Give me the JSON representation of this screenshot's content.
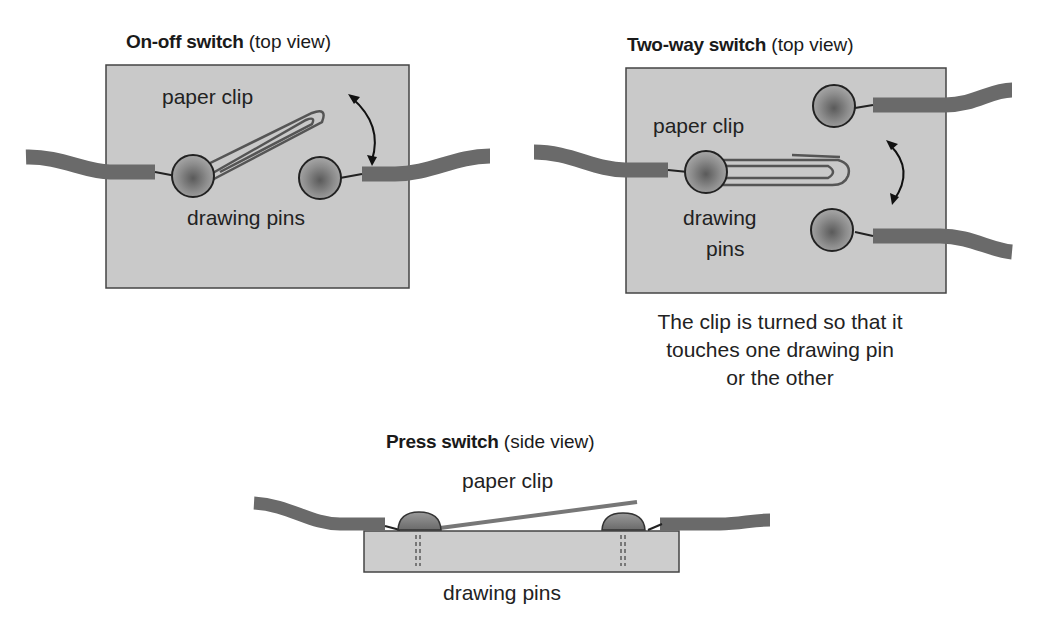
{
  "diagrams": {
    "on_off": {
      "title_bold": "On-off switch",
      "title_rest": " (top view)",
      "label_clip": "paper clip",
      "label_pins": "drawing pins"
    },
    "two_way": {
      "title_bold": "Two-way switch",
      "title_rest": " (top view)",
      "label_clip": "paper clip",
      "label_pins_line1": "drawing",
      "label_pins_line2": "pins",
      "caption_line1": "The clip is turned so that it",
      "caption_line2": "touches one drawing pin",
      "caption_line3": "or the other"
    },
    "press": {
      "title_bold": "Press switch",
      "title_rest": " (side view)",
      "label_clip": "paper clip",
      "label_pins": "drawing pins"
    }
  },
  "colors": {
    "board": "#c8c8c8",
    "wire": "#6a6a6a",
    "pin": "#8a8a8a",
    "outline": "#333333"
  }
}
